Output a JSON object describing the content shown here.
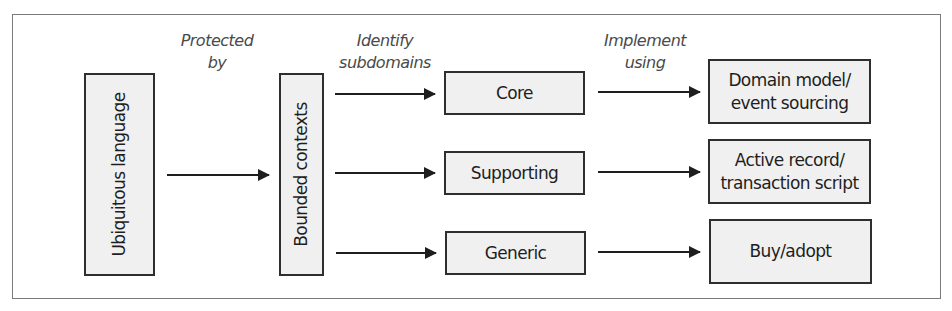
{
  "diagram": {
    "nodes": {
      "ubiquitous_language": "Ubiquitous language",
      "bounded_contexts": "Bounded contexts",
      "core": "Core",
      "supporting": "Supporting",
      "generic": "Generic",
      "domain_model": "Domain model/\nevent sourcing",
      "active_record": "Active record/\ntransaction script",
      "buy_adopt": "Buy/adopt"
    },
    "edge_labels": {
      "protected_by": "Protected\nby",
      "identify_subdomains": "Identify\nsubdomains",
      "implement_using": "Implement\nusing"
    },
    "edges": [
      {
        "from": "Ubiquitous language",
        "to": "Bounded contexts",
        "label": "Protected by"
      },
      {
        "from": "Bounded contexts",
        "to": "Core",
        "label": "Identify subdomains"
      },
      {
        "from": "Bounded contexts",
        "to": "Supporting",
        "label": "Identify subdomains"
      },
      {
        "from": "Bounded contexts",
        "to": "Generic",
        "label": "Identify subdomains"
      },
      {
        "from": "Core",
        "to": "Domain model/event sourcing",
        "label": "Implement using"
      },
      {
        "from": "Supporting",
        "to": "Active record/transaction script",
        "label": "Implement using"
      },
      {
        "from": "Generic",
        "to": "Buy/adopt",
        "label": "Implement using"
      }
    ],
    "colors": {
      "box_fill": "#f0f0f0",
      "box_border": "#2e2e2e",
      "arrow": "#1e1e1e",
      "label_text": "#4a4a4a",
      "frame_border": "#7a7a7a"
    }
  }
}
